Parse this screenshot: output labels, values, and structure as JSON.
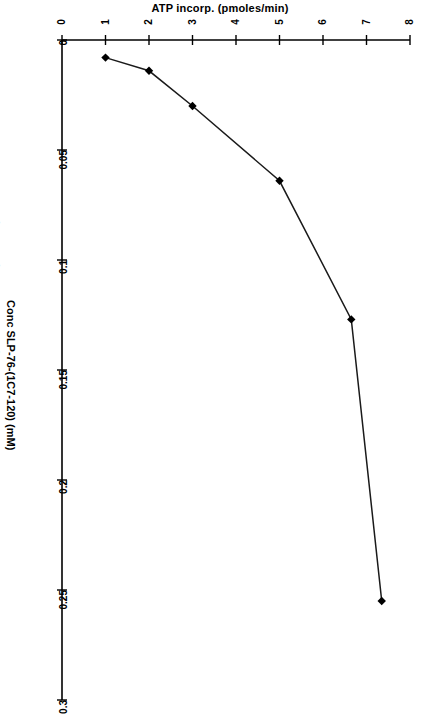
{
  "figure": {
    "caption_left": "Figure 3.  ATP incorporation in the kinase assay as a function of the concentration of the immunogen substrate SLP-76 (1C7-120)."
  },
  "chart_data": {
    "type": "line",
    "title": "ATP incorp. (pmoles/min)",
    "orientation": "rotated-90",
    "xlabel": "ATP incorp. (pmoles/min)",
    "ylabel": "Conc SLP-76-(1C7-120) (mM)",
    "xlim": [
      0,
      8
    ],
    "ylim": [
      0,
      0.3
    ],
    "grid": false,
    "legend": null,
    "xticks": [
      "0",
      "1",
      "2",
      "3",
      "4",
      "5",
      "6",
      "7",
      "8"
    ],
    "xtick_values": [
      0,
      1,
      2,
      3,
      4,
      5,
      6,
      7,
      8
    ],
    "yticks": [
      "0",
      "0.05",
      "0.1",
      "0.15",
      "0.2",
      "0.25",
      "0.3"
    ],
    "ytick_values": [
      0,
      0.05,
      0.1,
      0.15,
      0.2,
      0.25,
      0.3
    ],
    "series": [
      {
        "name": "ATP incorporation",
        "marker": "diamond",
        "color": "#000000",
        "x": [
          1.0,
          2.0,
          3.0,
          5.0,
          6.65,
          7.35
        ],
        "y": [
          0.008,
          0.014,
          0.03,
          0.064,
          0.127,
          0.255
        ],
        "points": [
          {
            "atp_incorp": 1.0,
            "conc_mM": 0.008
          },
          {
            "atp_incorp": 2.0,
            "conc_mM": 0.014
          },
          {
            "atp_incorp": 3.0,
            "conc_mM": 0.03
          },
          {
            "atp_incorp": 5.0,
            "conc_mM": 0.064
          },
          {
            "atp_incorp": 6.65,
            "conc_mM": 0.127
          },
          {
            "atp_incorp": 7.35,
            "conc_mM": 0.255
          }
        ]
      }
    ]
  }
}
